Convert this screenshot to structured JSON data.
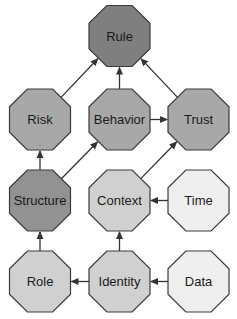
{
  "diagram": {
    "type": "directed-graph",
    "node_shape": "octagon",
    "nodes": [
      {
        "id": "rule",
        "label": "Rule",
        "cx": 119.5,
        "cy": 36,
        "fill": "#7f7f7f"
      },
      {
        "id": "risk",
        "label": "Risk",
        "cx": 40,
        "cy": 119.5,
        "fill": "#a8a8a8"
      },
      {
        "id": "behavior",
        "label": "Behavior",
        "cx": 119.5,
        "cy": 119.5,
        "fill": "#a8a8a8"
      },
      {
        "id": "trust",
        "label": "Trust",
        "cx": 198.5,
        "cy": 119.5,
        "fill": "#a8a8a8"
      },
      {
        "id": "structure",
        "label": "Structure",
        "cx": 40,
        "cy": 200.5,
        "fill": "#929292"
      },
      {
        "id": "context",
        "label": "Context",
        "cx": 119.5,
        "cy": 200.5,
        "fill": "#d0d0d0"
      },
      {
        "id": "time",
        "label": "Time",
        "cx": 198.5,
        "cy": 200.5,
        "fill": "#efefef"
      },
      {
        "id": "role",
        "label": "Role",
        "cx": 40,
        "cy": 281.5,
        "fill": "#d0d0d0"
      },
      {
        "id": "identity",
        "label": "Identity",
        "cx": 119.5,
        "cy": 281.5,
        "fill": "#d0d0d0"
      },
      {
        "id": "data",
        "label": "Data",
        "cx": 198.5,
        "cy": 281.5,
        "fill": "#efefef"
      }
    ],
    "edges": [
      {
        "from": "risk",
        "to": "rule"
      },
      {
        "from": "behavior",
        "to": "rule"
      },
      {
        "from": "trust",
        "to": "rule"
      },
      {
        "from": "behavior",
        "to": "trust"
      },
      {
        "from": "structure",
        "to": "risk"
      },
      {
        "from": "structure",
        "to": "behavior"
      },
      {
        "from": "context",
        "to": "trust"
      },
      {
        "from": "time",
        "to": "context"
      },
      {
        "from": "role",
        "to": "structure"
      },
      {
        "from": "identity",
        "to": "context"
      },
      {
        "from": "identity",
        "to": "role"
      },
      {
        "from": "data",
        "to": "identity"
      }
    ]
  }
}
